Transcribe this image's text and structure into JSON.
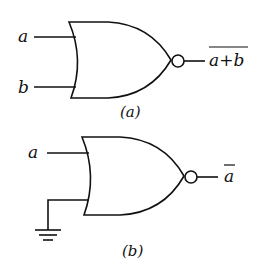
{
  "diagram": {
    "gate_a": {
      "type": "NOR gate",
      "inputs": [
        "a",
        "b"
      ],
      "output": "a+b",
      "output_overline": true,
      "caption": "(a)"
    },
    "gate_b": {
      "type": "NOR gate",
      "inputs": [
        "a",
        "ground"
      ],
      "output": "a",
      "output_overline": true,
      "caption": "(b)"
    },
    "colors": {
      "stroke": "#111111",
      "background": "#ffffff"
    }
  }
}
